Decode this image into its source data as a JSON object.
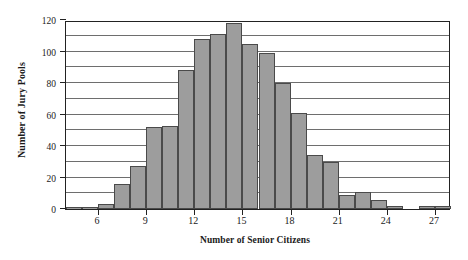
{
  "chart_data": {
    "type": "bar",
    "title": "",
    "subtitle": "",
    "xlabel": "Number of Senior Citizens",
    "ylabel": "Number of Jury Pools",
    "xlim": [
      4,
      28
    ],
    "ylim": [
      0,
      120
    ],
    "grid": true,
    "legend": null,
    "bin_width": 1,
    "x_tick_labels": [
      "6",
      "9",
      "12",
      "15",
      "18",
      "21",
      "24",
      "27"
    ],
    "x_tick_values": [
      6,
      9,
      12,
      15,
      18,
      21,
      24,
      27
    ],
    "y_tick_labels": [
      "0",
      "20",
      "40",
      "60",
      "80",
      "100",
      "120"
    ],
    "y_tick_values": [
      0,
      20,
      40,
      60,
      80,
      100,
      120
    ],
    "gridline_values": [
      10,
      20,
      30,
      40,
      50,
      60,
      70,
      80,
      90,
      100,
      110
    ],
    "bin_starts": [
      4,
      5,
      6,
      7,
      8,
      9,
      10,
      11,
      12,
      13,
      14,
      15,
      16,
      17,
      18,
      19,
      20,
      21,
      22,
      23,
      24,
      25,
      26,
      27
    ],
    "categories": [
      "4-5",
      "5-6",
      "6-7",
      "7-8",
      "8-9",
      "9-10",
      "10-11",
      "11-12",
      "12-13",
      "13-14",
      "14-15",
      "15-16",
      "16-17",
      "17-18",
      "18-19",
      "19-20",
      "20-21",
      "21-22",
      "22-23",
      "23-24",
      "24-25",
      "25-26",
      "26-27",
      "27-28"
    ],
    "values": [
      1,
      1,
      3,
      16,
      27,
      52,
      53,
      88,
      108,
      111,
      118,
      105,
      99,
      80,
      61,
      34,
      30,
      9,
      11,
      6,
      2,
      0,
      2,
      2
    ],
    "bar_fill_color": "#9d9d9d",
    "bar_edge_color": "#4a4a4a",
    "axis_color": "#222222",
    "grid_color": "#6e6e6e",
    "background_color": "#ffffff"
  }
}
